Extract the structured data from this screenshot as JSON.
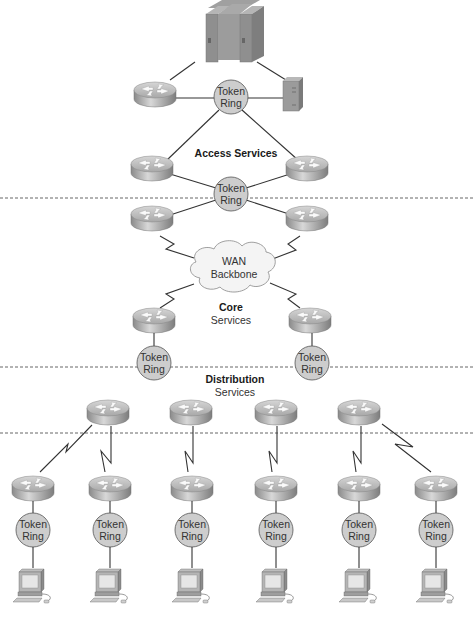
{
  "diagram": {
    "type": "hierarchical-network-topology",
    "colors": {
      "background": "#ffffff",
      "router_top": "#c9c9c9",
      "router_side": "#9a9a9a",
      "token_ring_fill": "#cfcfcf",
      "cloud_fill": "#f4f4f4",
      "link": "#333333",
      "divider": "#666666"
    },
    "zones": {
      "access": {
        "title": "Access Services"
      },
      "core": {
        "title": "Core",
        "subtitle": "Services"
      },
      "distribution": {
        "title": "Distribution",
        "subtitle": "Services"
      }
    },
    "wan": {
      "line1": "WAN",
      "line2": "Backbone"
    },
    "token_ring": {
      "line1": "Token",
      "line2": "Ring"
    },
    "nodes": {
      "mainframe": "mainframe-icon",
      "server": "server-icon",
      "router": "router-icon",
      "workstation": "workstation-icon",
      "token_ring": "token-ring-icon",
      "cloud": "cloud-icon"
    }
  }
}
